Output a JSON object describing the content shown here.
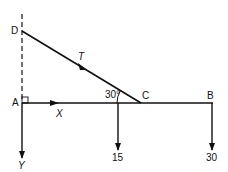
{
  "diagram": {
    "type": "statics-free-body-diagram",
    "points": {
      "D": {
        "label": "D"
      },
      "A": {
        "label": "A"
      },
      "C": {
        "label": "C"
      },
      "B": {
        "label": "B"
      }
    },
    "forces": {
      "tension": {
        "label": "T"
      },
      "horizontal_reaction": {
        "label": "X"
      },
      "vertical_reaction": {
        "label": "Y"
      },
      "load_mid": {
        "label": "15"
      },
      "load_end": {
        "label": "30"
      }
    },
    "angle": {
      "label": "30°"
    },
    "colors": {
      "stroke": "#111111",
      "background": "#ffffff"
    }
  }
}
